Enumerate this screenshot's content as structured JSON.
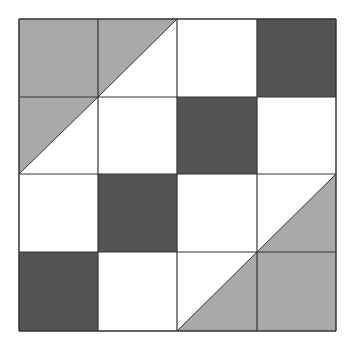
{
  "diagram": {
    "type": "quilt-block",
    "grid": {
      "rows": 4,
      "cols": 4,
      "x_lines": [
        19,
        98,
        177,
        257,
        336
      ],
      "y_lines": [
        19,
        97,
        174,
        252,
        331
      ]
    },
    "colors": {
      "light": "#a9a9a9",
      "dark": "#545454",
      "white": "#ffffff",
      "line": "#333333"
    },
    "cells": [
      [
        "light",
        "half-upper-left-light",
        "white",
        "dark"
      ],
      [
        "half-upper-left-light",
        "white",
        "dark",
        "white"
      ],
      [
        "white",
        "dark",
        "white",
        "half-lower-right-light"
      ],
      [
        "dark",
        "white",
        "half-lower-right-light",
        "light"
      ]
    ]
  }
}
